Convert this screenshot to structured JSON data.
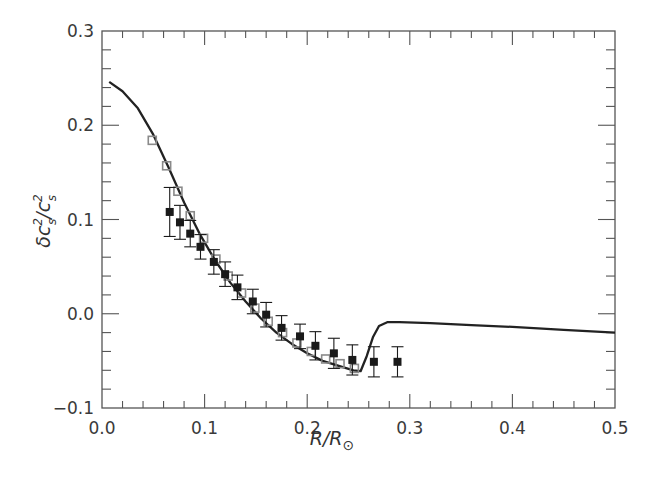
{
  "chart_data": {
    "type": "scatter",
    "title": "",
    "xlabel": "R/R⊙",
    "ylabel": "δc²s/c²s",
    "xlim": [
      0.0,
      0.5
    ],
    "ylim": [
      -0.1,
      0.3
    ],
    "grid": false,
    "legend": null,
    "x_ticks": [
      "0.0",
      "0.1",
      "0.2",
      "0.3",
      "0.4",
      "0.5"
    ],
    "y_ticks": [
      "−0.1",
      "0.0",
      "0.1",
      "0.2",
      "0.3"
    ],
    "series": [
      {
        "name": "model curve",
        "kind": "line",
        "color": "#222222",
        "x": [
          0.007,
          0.02,
          0.035,
          0.05,
          0.065,
          0.08,
          0.095,
          0.11,
          0.125,
          0.14,
          0.155,
          0.17,
          0.185,
          0.2,
          0.215,
          0.23,
          0.245,
          0.252,
          0.258,
          0.264,
          0.27,
          0.278,
          0.29,
          0.32,
          0.36,
          0.4,
          0.45,
          0.5
        ],
        "y": [
          0.246,
          0.236,
          0.218,
          0.19,
          0.155,
          0.118,
          0.085,
          0.057,
          0.033,
          0.013,
          -0.005,
          -0.02,
          -0.032,
          -0.042,
          -0.05,
          -0.055,
          -0.06,
          -0.061,
          -0.045,
          -0.025,
          -0.013,
          -0.009,
          -0.009,
          -0.01,
          -0.012,
          -0.014,
          -0.017,
          -0.02
        ]
      },
      {
        "name": "model points (hollow squares)",
        "kind": "scatter",
        "marker": "hollow-square",
        "color": "#8a8a8a",
        "x": [
          0.049,
          0.063,
          0.074,
          0.086,
          0.099,
          0.111,
          0.123,
          0.136,
          0.149,
          0.162,
          0.176,
          0.19,
          0.204,
          0.218,
          0.232,
          0.246
        ],
        "y": [
          0.184,
          0.157,
          0.13,
          0.104,
          0.08,
          0.058,
          0.04,
          0.022,
          0.006,
          -0.008,
          -0.02,
          -0.031,
          -0.04,
          -0.048,
          -0.053,
          -0.058
        ]
      },
      {
        "name": "observed (filled squares)",
        "kind": "errorbar",
        "marker": "filled-square",
        "color": "#1a1a1a",
        "x": [
          0.066,
          0.076,
          0.086,
          0.096,
          0.109,
          0.12,
          0.132,
          0.147,
          0.16,
          0.175,
          0.193,
          0.208,
          0.226,
          0.244,
          0.265,
          0.288
        ],
        "y": [
          0.108,
          0.097,
          0.085,
          0.071,
          0.055,
          0.042,
          0.028,
          0.013,
          -0.001,
          -0.015,
          -0.024,
          -0.034,
          -0.042,
          -0.049,
          -0.051,
          -0.051
        ],
        "err": [
          0.026,
          0.018,
          0.014,
          0.013,
          0.013,
          0.013,
          0.013,
          0.013,
          0.013,
          0.013,
          0.013,
          0.015,
          0.016,
          0.016,
          0.016,
          0.016
        ]
      }
    ]
  },
  "axes": {
    "x_label_main": "R/R",
    "x_label_sub": "⊙",
    "y_label_main": "δc",
    "y_label_sup1": "2",
    "y_label_sub1": "s",
    "y_label_slash": "/c",
    "y_label_sup2": "2",
    "y_label_sub2": "s"
  }
}
